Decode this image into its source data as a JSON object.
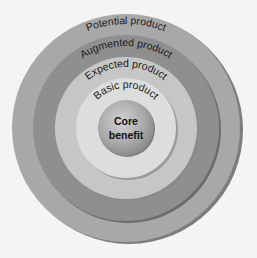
{
  "diagram": {
    "rings": [
      {
        "id": "potential",
        "label": "Potential product",
        "color": "#a8a8a8",
        "shadow": "#7d7d7d",
        "radius": 114
      },
      {
        "id": "augmented",
        "label": "Augmented product",
        "color": "#8f8f8f",
        "shadow": "#6c6c6c",
        "radius": 93
      },
      {
        "id": "expected",
        "label": "Expected product",
        "color": "#c6c6c6",
        "shadow": "#8a8a8a",
        "radius": 71
      },
      {
        "id": "basic",
        "label": "Basic product",
        "color": "#dddddd",
        "shadow": "#9a9a9a",
        "radius": 50
      }
    ],
    "core": {
      "line1": "Core",
      "line2": "benefit",
      "color": "#a3a3a3",
      "radius": 28
    },
    "background": "#f4f4f4"
  }
}
